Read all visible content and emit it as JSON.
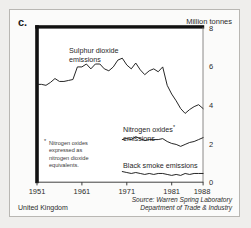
{
  "panel": {
    "letter": "c."
  },
  "unit": {
    "label": "Million tonnes"
  },
  "footer": {
    "country": "United Kingdom",
    "source_line1": "Source: Warren Spring Laboratory",
    "source_line2": "Department of Trade & Industry"
  },
  "footnote": {
    "marker": "*",
    "line1": "Nitrogen oxides",
    "line2": "expressed as",
    "line3": "nitrogen dioxide",
    "line4": "equivalents."
  },
  "annotations": {
    "so2_line1": "Sulphur dioxide",
    "so2_line2": "emissions",
    "nox_line1": "Nitrogen oxides",
    "nox_marker": "*",
    "nox_line2": "emissions",
    "smoke_line1": "Black smoke emissions"
  },
  "colors": {
    "line": "#1a1a1a",
    "frame": "#111111",
    "panel_bg": "#fbfbfa",
    "page_bg": "#efeeec",
    "border": "#b9b7b3"
  },
  "chart_data": {
    "type": "line",
    "title": "",
    "xlabel": "",
    "ylabel": "Million tonnes",
    "xlim": [
      1951,
      1988
    ],
    "ylim": [
      0,
      8
    ],
    "yticks": [
      0,
      2,
      4,
      6,
      8
    ],
    "xticks": [
      1951,
      1961,
      1971,
      1981,
      1988
    ],
    "grid": false,
    "legend": "inline-annotations",
    "x": [
      1951,
      1952,
      1953,
      1954,
      1955,
      1956,
      1957,
      1958,
      1959,
      1960,
      1961,
      1962,
      1963,
      1964,
      1965,
      1966,
      1967,
      1968,
      1969,
      1970,
      1971,
      1972,
      1973,
      1974,
      1975,
      1976,
      1977,
      1978,
      1979,
      1980,
      1981,
      1982,
      1983,
      1984,
      1985,
      1986,
      1987,
      1988
    ],
    "series": [
      {
        "name": "Sulphur dioxide emissions",
        "values": [
          5.05,
          5.05,
          5.0,
          5.15,
          5.35,
          5.2,
          5.2,
          5.25,
          5.3,
          5.95,
          5.95,
          6.1,
          5.85,
          6.1,
          6.1,
          5.85,
          5.75,
          5.95,
          6.3,
          6.4,
          6.05,
          5.85,
          6.15,
          5.8,
          5.55,
          5.75,
          5.85,
          5.7,
          5.95,
          5.0,
          4.55,
          4.2,
          3.8,
          3.55,
          3.75,
          3.9,
          4.0,
          3.8
        ]
      },
      {
        "name": "Nitrogen oxides emissions",
        "values": [
          null,
          null,
          null,
          null,
          null,
          null,
          null,
          null,
          null,
          null,
          null,
          null,
          null,
          null,
          null,
          null,
          null,
          null,
          null,
          2.2,
          2.25,
          2.2,
          2.35,
          2.25,
          2.15,
          2.2,
          2.2,
          2.2,
          2.25,
          2.1,
          2.0,
          1.95,
          1.85,
          1.95,
          2.05,
          2.1,
          2.2,
          2.3
        ]
      },
      {
        "name": "Black smoke emissions",
        "values": [
          null,
          null,
          null,
          null,
          null,
          null,
          null,
          null,
          null,
          null,
          null,
          null,
          null,
          null,
          null,
          null,
          null,
          null,
          null,
          0.55,
          0.5,
          0.45,
          0.5,
          0.45,
          0.4,
          0.45,
          0.4,
          0.45,
          0.45,
          0.4,
          0.35,
          0.4,
          0.35,
          0.45,
          0.4,
          0.45,
          0.45,
          0.45
        ]
      }
    ]
  }
}
